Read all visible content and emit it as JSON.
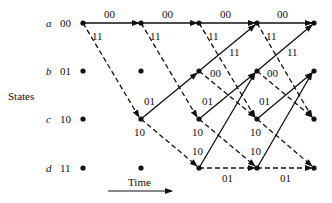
{
  "axis": {
    "states_label": "States",
    "time_label": "Time"
  },
  "states": [
    {
      "letter": "a",
      "code": "00"
    },
    {
      "letter": "b",
      "code": "01"
    },
    {
      "letter": "c",
      "code": "10"
    },
    {
      "letter": "d",
      "code": "11"
    }
  ],
  "branch_labels": {
    "a_a": "00",
    "a_c": "11",
    "b_a": "11",
    "b_c": "00",
    "c_b": "01",
    "c_d": "10",
    "d_b": "10",
    "d_d": "01"
  },
  "legend": {
    "solid": "input 0",
    "dashed": "input 1"
  }
}
